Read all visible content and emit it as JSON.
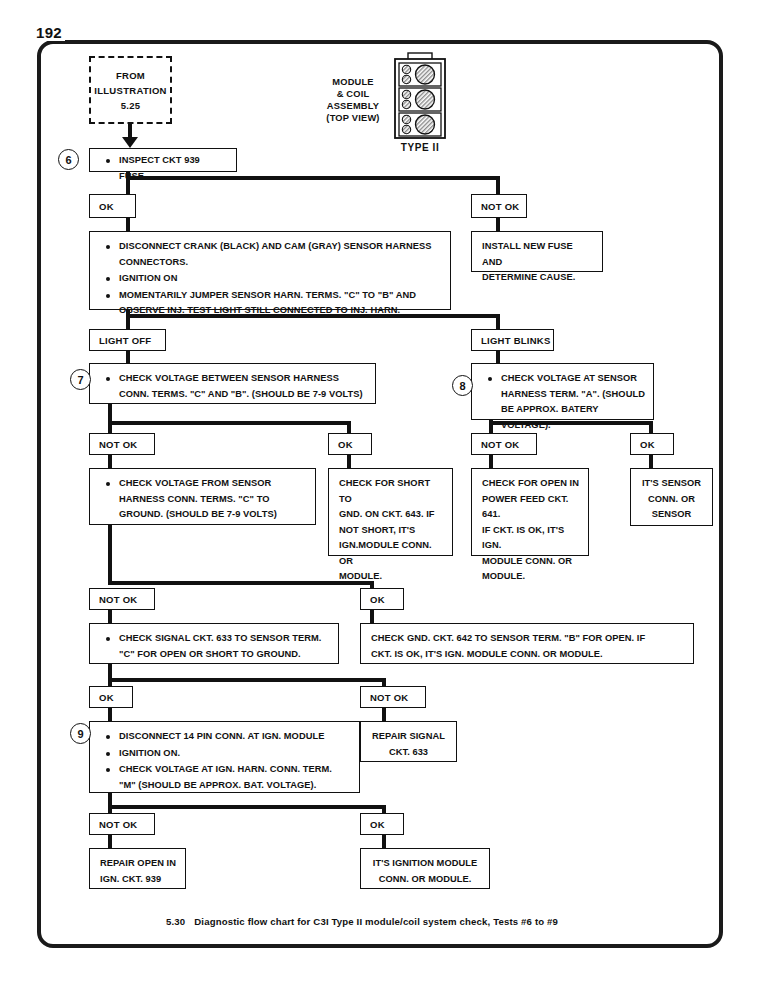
{
  "page": {
    "number": "192",
    "caption_number": "5.30",
    "caption_text": "Diagnostic flow chart for C3I Type II module/coil system check, Tests #6 to #9"
  },
  "module_illustration": {
    "caption_lines": [
      "MODULE",
      "& COIL",
      "ASSEMBLY",
      "(TOP VIEW)"
    ],
    "type_label": "TYPE II",
    "coil_sections": 3,
    "small_terminals_per_section": 2,
    "large_coils_per_section": 1
  },
  "entry_note": {
    "lines": [
      "FROM",
      "ILLUSTRATION",
      "5.25"
    ]
  },
  "steps": {
    "step6": "6",
    "step7": "7",
    "step8": "8",
    "step9": "9"
  },
  "nodes": {
    "inspect_fuse": {
      "bullets": [
        "INSPECT CKT 939 FUSE."
      ]
    },
    "branch_ok_1": {
      "label": "OK"
    },
    "branch_notok_1": {
      "label": "NOT OK"
    },
    "install_new_fuse": {
      "lines": [
        "INSTALL NEW FUSE AND",
        "DETERMINE CAUSE."
      ]
    },
    "disconnect_sensors": {
      "bullets": [
        "DISCONNECT CRANK (BLACK) AND CAM (GRAY) SENSOR HARNESS CONNECTORS.",
        "IGNITION ON",
        "MOMENTARILY JUMPER  SENSOR HARN. TERMS. \"C\" TO \"B\" AND OBSERVE INJ. TEST LIGHT STILL CONNECTED TO INJ. HARN."
      ]
    },
    "branch_light_off": {
      "label": "LIGHT OFF"
    },
    "branch_light_blinks": {
      "label": "LIGHT BLINKS"
    },
    "check_voltage_cb": {
      "bullets": [
        "CHECK VOLTAGE BETWEEN SENSOR HARNESS CONN. TERMS. \"C\" AND \"B\". (SHOULD BE 7-9 VOLTS)"
      ]
    },
    "check_voltage_a": {
      "bullets": [
        "CHECK VOLTAGE AT  SENSOR HARNESS TERM. \"A\". (SHOULD BE APPROX. BATERY VOLTAGE)."
      ]
    },
    "branch_notok_2": {
      "label": "NOT OK"
    },
    "branch_ok_2": {
      "label": "OK"
    },
    "branch_notok_3": {
      "label": "NOT OK"
    },
    "branch_ok_3": {
      "label": "OK"
    },
    "check_voltage_ground": {
      "bullets": [
        "CHECK VOLTAGE FROM  SENSOR HARNESS CONN. TERMS. \"C\" TO GROUND. (SHOULD BE 7-9 VOLTS)"
      ]
    },
    "check_short_643": {
      "lines": [
        "CHECK FOR SHORT TO",
        "GND.  ON CKT. 643.  IF",
        "NOT SHORT, IT'S",
        "IGN.MODULE CONN. OR",
        "MODULE."
      ]
    },
    "check_open_641": {
      "lines": [
        "CHECK FOR OPEN IN",
        "POWER FEED CKT. 641.",
        "IF CKT. IS OK, IT'S IGN.",
        "MODULE CONN. OR",
        "MODULE."
      ]
    },
    "its_sensor": {
      "lines": [
        "IT'S SENSOR",
        "CONN. OR",
        "SENSOR"
      ]
    },
    "branch_notok_4": {
      "label": "NOT OK"
    },
    "branch_ok_4": {
      "label": "OK"
    },
    "check_signal_633": {
      "bullets": [
        "CHECK SIGNAL CKT. 633 TO SENSOR TERM. \"C\" FOR OPEN OR SHORT TO GROUND."
      ]
    },
    "check_gnd_642": {
      "lines": [
        "CHECK GND. CKT. 642 TO  SENSOR TERM. \"B\" FOR OPEN. IF",
        "CKT. IS OK, IT'S IGN. MODULE CONN. OR MODULE."
      ]
    },
    "branch_ok_5": {
      "label": "OK"
    },
    "branch_notok_5": {
      "label": "NOT OK"
    },
    "disconnect_14pin": {
      "bullets": [
        "DISCONNECT 14 PIN CONN. AT IGN. MODULE",
        "IGNITION ON.",
        "CHECK VOLTAGE AT IGN. HARN. CONN. TERM. \"M\" (SHOULD BE APPROX. BAT. VOLTAGE)."
      ]
    },
    "repair_signal_633": {
      "lines": [
        "REPAIR SIGNAL",
        "CKT. 633"
      ]
    },
    "branch_notok_6": {
      "label": "NOT OK"
    },
    "branch_ok_6": {
      "label": "OK"
    },
    "repair_open_939": {
      "lines": [
        "REPAIR OPEN IN",
        "IGN. CKT. 939"
      ]
    },
    "its_ignition_module": {
      "lines": [
        "IT'S IGNITION MODULE",
        "CONN. OR MODULE."
      ]
    }
  },
  "colors": {
    "ink": "#111111",
    "paper": "#ffffff"
  }
}
